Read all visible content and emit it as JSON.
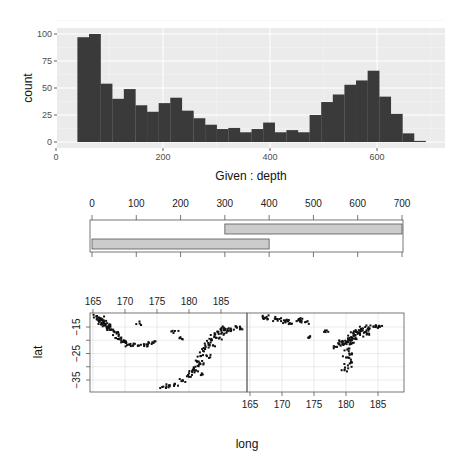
{
  "chart_data": [
    {
      "type": "bar",
      "subtype": "histogram",
      "title": "",
      "xlabel": "Given : depth",
      "ylabel": "count",
      "xlim": [
        0,
        700
      ],
      "ylim": [
        0,
        100
      ],
      "x_ticks": [
        0,
        200,
        400,
        600
      ],
      "y_ticks": [
        0,
        25,
        50,
        75,
        100
      ],
      "grid": true,
      "background": "#ebebeb",
      "bar_color": "#3a3a3a",
      "bin_width": 21.7,
      "bins_start": 40,
      "values": [
        97,
        100,
        54,
        40,
        49,
        34,
        28,
        36,
        41,
        29,
        22,
        16,
        12,
        13,
        9,
        12,
        18,
        9,
        11,
        9,
        25,
        37,
        44,
        53,
        57,
        66,
        42,
        26,
        8,
        1
      ]
    },
    {
      "type": "bar",
      "subtype": "given-intervals",
      "x_ticks": [
        0,
        100,
        200,
        300,
        400,
        500,
        600,
        700
      ],
      "xlim": [
        0,
        700
      ],
      "intervals": [
        {
          "from": 0,
          "to": 400
        },
        {
          "from": 300,
          "to": 700
        }
      ],
      "fill": "#cccccc"
    },
    {
      "type": "scatter",
      "xlabel": "long",
      "ylabel": "lat",
      "x_ticks": [
        165,
        170,
        175,
        180,
        185
      ],
      "y_ticks": [
        -15,
        -25,
        -35
      ],
      "xlim": [
        164,
        188.5
      ],
      "ylim": [
        -39,
        -10
      ],
      "panels": [
        {
          "condition": "depth 0-400",
          "points": [
            [
              165.6,
              -11
            ],
            [
              165.9,
              -11.4
            ],
            [
              166.2,
              -11.8
            ],
            [
              166.5,
              -12.2
            ],
            [
              166.0,
              -12.6
            ],
            [
              166.7,
              -13
            ],
            [
              166.3,
              -13.4
            ],
            [
              167.0,
              -13.8
            ],
            [
              166.8,
              -14.3
            ],
            [
              167.2,
              -14.8
            ],
            [
              167.5,
              -15.3
            ],
            [
              167.8,
              -15.9
            ],
            [
              168.2,
              -16.6
            ],
            [
              168.7,
              -17.5
            ],
            [
              169.0,
              -18.4
            ],
            [
              169.4,
              -19.3
            ],
            [
              169.8,
              -20.0
            ],
            [
              170.2,
              -20.9
            ],
            [
              170.6,
              -21.6
            ],
            [
              171.3,
              -21.9
            ],
            [
              172.0,
              -22.0
            ],
            [
              173.0,
              -22.2
            ],
            [
              173.6,
              -21.5
            ],
            [
              174.3,
              -20.8
            ],
            [
              172.3,
              -13.7
            ],
            [
              177.8,
              -16.5
            ],
            [
              178.9,
              -19.5
            ],
            [
              176.0,
              -37.5
            ],
            [
              177.0,
              -37.0
            ],
            [
              177.8,
              -36.5
            ],
            [
              179.0,
              -35.0
            ],
            [
              180.0,
              -33.8
            ],
            [
              180.5,
              -32.0
            ],
            [
              181.0,
              -30.0
            ],
            [
              181.5,
              -28.0
            ],
            [
              181.8,
              -26.0
            ],
            [
              182.2,
              -24.0
            ],
            [
              182.6,
              -22.5
            ],
            [
              183.0,
              -21.0
            ],
            [
              183.5,
              -19.5
            ],
            [
              184.0,
              -18.0
            ],
            [
              184.5,
              -17.0
            ],
            [
              185.0,
              -16.0
            ],
            [
              185.5,
              -15.5
            ],
            [
              186.0,
              -15.8
            ],
            [
              186.5,
              -16.3
            ],
            [
              187.0,
              -16.0
            ],
            [
              187.5,
              -15.2
            ],
            [
              188.0,
              -15.5
            ],
            [
              185.5,
              -17.5
            ],
            [
              184.8,
              -19.0
            ],
            [
              183.8,
              -22.0
            ],
            [
              182.8,
              -26.0
            ],
            [
              181.8,
              -29.0
            ],
            [
              181.0,
              -31.5
            ],
            [
              182.0,
              -32.5
            ]
          ]
        },
        {
          "condition": "depth 300-700",
          "points": [
            [
              167.3,
              -11.5
            ],
            [
              167.6,
              -11.2
            ],
            [
              169.2,
              -12.0
            ],
            [
              169.6,
              -12.0
            ],
            [
              170.3,
              -12.5
            ],
            [
              170.5,
              -13.0
            ],
            [
              171.2,
              -13.5
            ],
            [
              172.5,
              -12.5
            ],
            [
              172.8,
              -12.3
            ],
            [
              173.6,
              -13.2
            ],
            [
              174.4,
              -18.5
            ],
            [
              177.0,
              -16.3
            ],
            [
              178.6,
              -22.5
            ],
            [
              179.0,
              -21.5
            ],
            [
              179.3,
              -20.5
            ],
            [
              179.6,
              -21.8
            ],
            [
              180.0,
              -20.8
            ],
            [
              180.4,
              -19.8
            ],
            [
              180.8,
              -18.8
            ],
            [
              181.2,
              -17.5
            ],
            [
              181.6,
              -16.8
            ],
            [
              182.0,
              -16.3
            ],
            [
              182.5,
              -15.6
            ],
            [
              183.0,
              -15.0
            ],
            [
              183.6,
              -15.8
            ],
            [
              184.3,
              -14.8
            ],
            [
              185.0,
              -15.3
            ],
            [
              185.2,
              -14.7
            ],
            [
              180.2,
              -23.5
            ],
            [
              180.5,
              -25.0
            ],
            [
              180.0,
              -26.5
            ],
            [
              180.8,
              -28.0
            ],
            [
              180.3,
              -29.5
            ],
            [
              179.8,
              -31.0
            ],
            [
              180.6,
              -20.0
            ],
            [
              181.0,
              -21.0
            ],
            [
              181.5,
              -19.0
            ],
            [
              182.2,
              -18.0
            ],
            [
              182.8,
              -17.2
            ],
            [
              183.6,
              -17.5
            ]
          ]
        }
      ]
    }
  ],
  "histogram": {
    "ylabel": "count",
    "xlabel": "Given : depth",
    "y_ticks": [
      "0",
      "25",
      "50",
      "75",
      "100"
    ],
    "x_ticks": [
      "0",
      "200",
      "400",
      "600"
    ]
  },
  "given_panel": {
    "x_ticks": [
      "0",
      "100",
      "200",
      "300",
      "400",
      "500",
      "600",
      "700"
    ]
  },
  "scatter": {
    "xlabel": "long",
    "ylabel": "lat",
    "top_ticks": [
      "165",
      "170",
      "175",
      "180",
      "185"
    ],
    "bottom_ticks": [
      "165",
      "170",
      "175",
      "180",
      "185"
    ],
    "y_ticks": [
      "-15",
      "-25",
      "-35"
    ]
  }
}
